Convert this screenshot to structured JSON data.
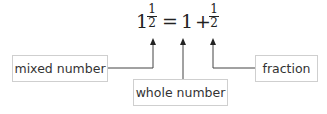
{
  "equation": {
    "mixed_whole": "1",
    "mixed_num": "1",
    "mixed_den": "2",
    "equals": "=",
    "whole": "1",
    "plus": "+",
    "frac_num": "1",
    "frac_den": "2"
  },
  "labels": {
    "mixed": "mixed number",
    "whole": "whole number",
    "fraction": "fraction"
  },
  "colors": {
    "line": "#444444",
    "box_border": "#cfcfcf",
    "text": "#333333"
  }
}
